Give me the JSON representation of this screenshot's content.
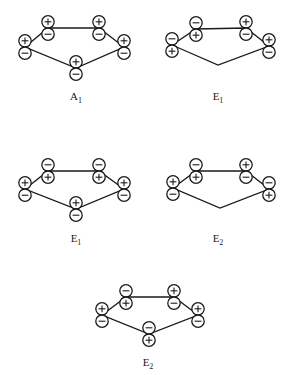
{
  "figure": {
    "colors": {
      "ink": "#1a1a1a",
      "background": "#ffffff"
    },
    "lobe_radius": 6.2,
    "diagrams": [
      {
        "id": "A1",
        "label_main": "A",
        "label_sub": "1",
        "label_pos": [
          76,
          90
        ],
        "vertices": [
          [
            25,
            47
          ],
          [
            48,
            28
          ],
          [
            99,
            28
          ],
          [
            124,
            47
          ],
          [
            76,
            68
          ]
        ],
        "orbitals": [
          {
            "x": 25,
            "top": "+",
            "bottom": "-"
          },
          {
            "x": 48,
            "top": "+",
            "bottom": "-"
          },
          {
            "x": 99,
            "top": "+",
            "bottom": "-"
          },
          {
            "x": 124,
            "top": "+",
            "bottom": "-"
          },
          {
            "x": 76,
            "top": "+",
            "bottom": "-"
          }
        ]
      },
      {
        "id": "E1a",
        "label_main": "E",
        "label_sub": "1",
        "label_pos": [
          218,
          90
        ],
        "vertices": [
          [
            172,
            45
          ],
          [
            196,
            29
          ],
          [
            246,
            28
          ],
          [
            269,
            46
          ],
          [
            218,
            65
          ]
        ],
        "orbitals": [
          {
            "x": 172,
            "top": "-",
            "bottom": "+"
          },
          {
            "x": 196,
            "top": "-",
            "bottom": "+"
          },
          {
            "x": 246,
            "top": "+",
            "bottom": "-"
          },
          {
            "x": 269,
            "top": "+",
            "bottom": "-"
          },
          null
        ]
      },
      {
        "id": "E1b",
        "label_main": "E",
        "label_sub": "1",
        "label_pos": [
          76,
          232
        ],
        "vertices": [
          [
            25,
            189
          ],
          [
            48,
            171
          ],
          [
            99,
            171
          ],
          [
            124,
            189
          ],
          [
            76,
            209
          ]
        ],
        "orbitals": [
          {
            "x": 25,
            "top": "+",
            "bottom": "-"
          },
          {
            "x": 48,
            "top": "-",
            "bottom": "+"
          },
          {
            "x": 99,
            "top": "-",
            "bottom": "+"
          },
          {
            "x": 124,
            "top": "+",
            "bottom": "-"
          },
          {
            "x": 76,
            "top": "+",
            "bottom": "-"
          }
        ]
      },
      {
        "id": "E2a",
        "label_main": "E",
        "label_sub": "2",
        "label_pos": [
          218,
          232
        ],
        "vertices": [
          [
            173,
            188
          ],
          [
            196,
            171
          ],
          [
            246,
            171
          ],
          [
            269,
            189
          ],
          [
            220,
            208
          ]
        ],
        "orbitals": [
          {
            "x": 173,
            "top": "+",
            "bottom": "-"
          },
          {
            "x": 196,
            "top": "-",
            "bottom": "+"
          },
          {
            "x": 246,
            "top": "+",
            "bottom": "-"
          },
          {
            "x": 269,
            "top": "-",
            "bottom": "+"
          },
          null
        ]
      },
      {
        "id": "E2b",
        "label_main": "E",
        "label_sub": "2",
        "label_pos": [
          148,
          356
        ],
        "vertices": [
          [
            102,
            315
          ],
          [
            126,
            297
          ],
          [
            174,
            297
          ],
          [
            198,
            315
          ],
          [
            149,
            334
          ]
        ],
        "orbitals": [
          {
            "x": 102,
            "top": "+",
            "bottom": "-"
          },
          {
            "x": 126,
            "top": "-",
            "bottom": "+"
          },
          {
            "x": 174,
            "top": "+",
            "bottom": "-"
          },
          {
            "x": 198,
            "top": "+",
            "bottom": "-"
          },
          {
            "x": 149,
            "top": "-",
            "bottom": "+"
          }
        ]
      }
    ]
  }
}
